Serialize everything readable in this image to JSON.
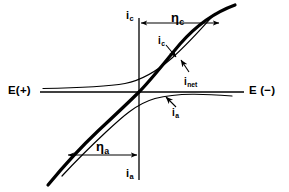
{
  "figure": {
    "width": 289,
    "height": 192,
    "background_color": "#ffffff",
    "line_color": "#000000"
  },
  "axes": {
    "vertical": {
      "x": 139,
      "y_top": 18,
      "y_bottom": 180,
      "top_label": "i",
      "top_label_sub": "c",
      "bottom_label": "i",
      "bottom_label_sub": "a"
    },
    "horizontal": {
      "y": 92,
      "x_left": 40,
      "x_right": 244,
      "left_label": "E(+)",
      "right_label": "E (−)"
    },
    "origin": {
      "x": 139,
      "y": 92
    }
  },
  "curves": [
    {
      "id": "i-net",
      "label": "i",
      "label_sub": "net",
      "style": "thick",
      "stroke_width": 3.2,
      "description": "net current, S-shaped curve through origin"
    },
    {
      "id": "i-c",
      "label": "i",
      "label_sub": "c",
      "style": "thin",
      "stroke_width": 1.2,
      "description": "cathodic partial current, asymptotic to E axis on left"
    },
    {
      "id": "i-a",
      "label": "i",
      "label_sub": "a",
      "style": "thin",
      "stroke_width": 1.2,
      "description": "anodic partial current, asymptotic to E axis on right"
    }
  ],
  "annotations": [
    {
      "id": "eta-c",
      "label": "η",
      "label_sub": "c",
      "kind": "double-headed-arrow",
      "orientation": "horizontal",
      "from_x": 141,
      "to_x": 219,
      "y": 23,
      "description": "cathodic overpotential measured from i axis to net curve"
    },
    {
      "id": "eta-a",
      "label": "η",
      "label_sub": "a",
      "kind": "double-headed-arrow",
      "orientation": "horizontal",
      "from_x": 68,
      "to_x": 137,
      "y": 155,
      "description": "anodic overpotential measured from net curve to i axis"
    }
  ],
  "labels": {
    "i_c_axis": {
      "text": "i",
      "sub": "c",
      "x": 126,
      "y": 10
    },
    "i_a_axis": {
      "text": "i",
      "sub": "a",
      "x": 126,
      "y": 168
    },
    "e_positive": {
      "text": "E(+)",
      "x": 8,
      "y": 85
    },
    "e_negative": {
      "text": "E (−)",
      "x": 249,
      "y": 85
    },
    "eta_c": {
      "text": "η",
      "sub": "c",
      "x": 171,
      "y": 11
    },
    "eta_a": {
      "text": "η",
      "sub": "a",
      "x": 96,
      "y": 140
    },
    "i_c_curve": {
      "text": "i",
      "sub": "c",
      "x": 158,
      "y": 36
    },
    "i_net_curve": {
      "text": "i",
      "sub": "net",
      "x": 184,
      "y": 77
    },
    "i_a_curve": {
      "text": "i",
      "sub": "a",
      "x": 172,
      "y": 108
    }
  }
}
